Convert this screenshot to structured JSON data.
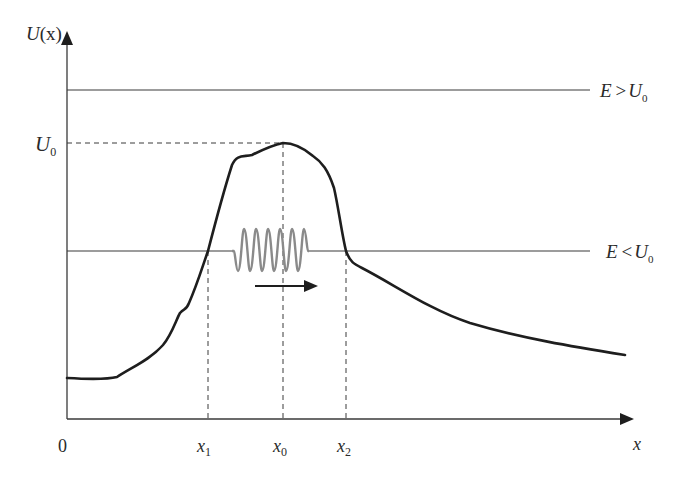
{
  "diagram": {
    "colors": {
      "axis": "#3a3a3a",
      "curve": "#1e1e1e",
      "energy_line": "#3a3a3a",
      "dashed": "#3a3a3a",
      "wave": "#8a8a8a",
      "arrow": "#1e1e1e"
    },
    "axes": {
      "y_label_main": "U",
      "y_label_arg": "(x)",
      "x_label": "x",
      "origin_label": "0"
    },
    "levels": {
      "u0_label": "U",
      "u0_sub": "0",
      "high_energy_label_E": "E",
      "high_energy_label_op": ">",
      "high_energy_label_U": "U",
      "high_energy_label_sub": "0",
      "low_energy_label_E": "E",
      "low_energy_label_op": "<",
      "low_energy_label_U": "U",
      "low_energy_label_sub": "0"
    },
    "x_ticks": [
      {
        "main": "x",
        "sub": "1"
      },
      {
        "main": "x",
        "sub": "0"
      },
      {
        "main": "x",
        "sub": "2"
      }
    ]
  }
}
